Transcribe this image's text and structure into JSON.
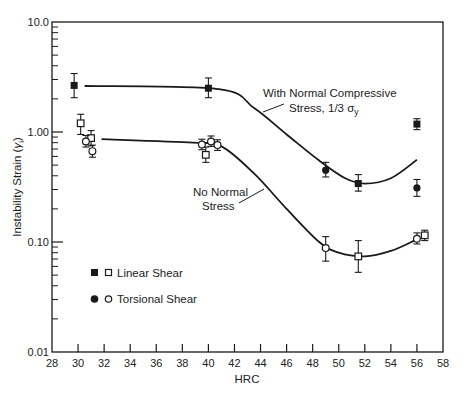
{
  "chart_data": {
    "type": "scatter",
    "title": "",
    "xlabel": "HRC",
    "ylabel": "Instability Strain (γi)",
    "xlim": [
      28,
      58
    ],
    "ylim": [
      0.01,
      10.0
    ],
    "yscale": "log",
    "grid": false,
    "x_ticks": [
      28,
      30,
      32,
      34,
      36,
      38,
      40,
      42,
      44,
      46,
      48,
      50,
      52,
      54,
      56,
      58
    ],
    "y_ticks": [
      {
        "value": 0.01,
        "label": "0.01"
      },
      {
        "value": 0.1,
        "label": "0.10"
      },
      {
        "value": 1.0,
        "label": "1.00"
      },
      {
        "value": 10.0,
        "label": "10.0"
      }
    ],
    "legend": {
      "position": "lower-left",
      "entries": [
        {
          "label": "Linear Shear",
          "markers": [
            "filled-square",
            "open-square"
          ]
        },
        {
          "label": "Torsional Shear",
          "markers": [
            "filled-circle",
            "open-circle"
          ]
        }
      ]
    },
    "series": [
      {
        "name": "Linear Shear, With Normal Compressive Stress",
        "marker": "filled-square",
        "points": [
          {
            "x": 29.7,
            "y": 2.65,
            "err_lo": 2.05,
            "err_hi": 3.4
          },
          {
            "x": 40.0,
            "y": 2.5,
            "err_lo": 2.05,
            "err_hi": 3.1
          },
          {
            "x": 51.5,
            "y": 0.34,
            "err_lo": 0.29,
            "err_hi": 0.41
          },
          {
            "x": 56.0,
            "y": 1.18,
            "err_lo": 1.05,
            "err_hi": 1.32
          }
        ]
      },
      {
        "name": "Torsional Shear, With Normal Compressive Stress",
        "marker": "filled-circle",
        "points": [
          {
            "x": 49.0,
            "y": 0.45,
            "err_lo": 0.39,
            "err_hi": 0.53
          },
          {
            "x": 56.0,
            "y": 0.31,
            "err_lo": 0.26,
            "err_hi": 0.37
          }
        ]
      },
      {
        "name": "Linear Shear, No Normal Stress",
        "marker": "open-square",
        "points": [
          {
            "x": 30.2,
            "y": 1.2,
            "err_lo": 0.95,
            "err_hi": 1.45
          },
          {
            "x": 31.0,
            "y": 0.88,
            "err_lo": 0.75,
            "err_hi": 1.03
          },
          {
            "x": 39.8,
            "y": 0.62,
            "err_lo": 0.53,
            "err_hi": 0.73
          },
          {
            "x": 51.5,
            "y": 0.074,
            "err_lo": 0.053,
            "err_hi": 0.103
          },
          {
            "x": 56.6,
            "y": 0.115,
            "err_lo": 0.103,
            "err_hi": 0.128
          }
        ]
      },
      {
        "name": "Torsional Shear, No Normal Stress",
        "marker": "open-circle",
        "points": [
          {
            "x": 30.6,
            "y": 0.82,
            "err_lo": 0.73,
            "err_hi": 0.93
          },
          {
            "x": 31.1,
            "y": 0.67,
            "err_lo": 0.59,
            "err_hi": 0.76
          },
          {
            "x": 39.5,
            "y": 0.77,
            "err_lo": 0.69,
            "err_hi": 0.86
          },
          {
            "x": 40.2,
            "y": 0.82,
            "err_lo": 0.74,
            "err_hi": 0.92
          },
          {
            "x": 40.7,
            "y": 0.76,
            "err_lo": 0.68,
            "err_hi": 0.85
          },
          {
            "x": 49.0,
            "y": 0.088,
            "err_lo": 0.067,
            "err_hi": 0.112
          },
          {
            "x": 56.0,
            "y": 0.107,
            "err_lo": 0.096,
            "err_hi": 0.121
          }
        ]
      }
    ],
    "curves": [
      {
        "name": "With Normal Compressive Stress, 1/3 σy",
        "points": [
          [
            30.5,
            2.62
          ],
          [
            40.8,
            2.45
          ],
          [
            43.5,
            1.65
          ],
          [
            46,
            0.95
          ],
          [
            48.5,
            0.55
          ],
          [
            50.5,
            0.38
          ],
          [
            52,
            0.34
          ],
          [
            54,
            0.38
          ],
          [
            56,
            0.56
          ]
        ]
      },
      {
        "name": "No Normal Stress",
        "points": [
          [
            31.8,
            0.86
          ],
          [
            38.8,
            0.8
          ],
          [
            41,
            0.74
          ],
          [
            43.5,
            0.42
          ],
          [
            46,
            0.2
          ],
          [
            48.5,
            0.1
          ],
          [
            50,
            0.08
          ],
          [
            52,
            0.074
          ],
          [
            54,
            0.083
          ],
          [
            55.8,
            0.103
          ]
        ]
      }
    ],
    "annotations": [
      {
        "text_line1": "With Normal Compressive",
        "text_line2": "Stress, 1/3 σ",
        "subscript": "y",
        "points_to": [
          43.5,
          1.4
        ]
      },
      {
        "text_line1": "No Normal",
        "text_line2": "Stress",
        "points_to": [
          45.1,
          0.36
        ]
      }
    ]
  },
  "labels": {
    "xlabel": "HRC",
    "ylabel_main": "Instability Strain (",
    "ylabel_sym": "γ",
    "ylabel_sub": "i",
    "ylabel_close": ")",
    "legend_linear": "Linear Shear",
    "legend_torsional": "Torsional Shear",
    "annot1_line1": "With Normal Compressive",
    "annot1_line2": "Stress, 1/3 σ",
    "annot1_sub": "y",
    "annot2_line1": "No Normal",
    "annot2_line2": "Stress"
  },
  "colors": {
    "ink": "#1a1a1a",
    "background": "#ffffff"
  }
}
